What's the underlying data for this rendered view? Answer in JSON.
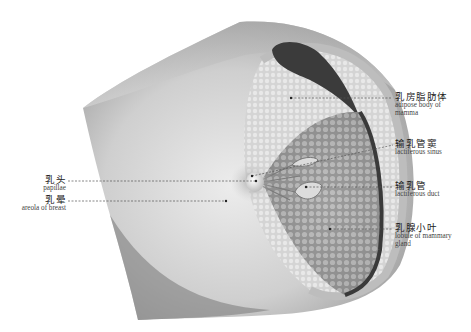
{
  "figure": {
    "type": "anatomical illustration",
    "colors": {
      "skin": "#bdbdbd",
      "skin_light": "#e6e6e6",
      "gland": "#9a9a9a",
      "gland_dark": "#4a4a4a",
      "leader_line": "#555555"
    }
  },
  "labels": {
    "right": [
      {
        "zh": "乳房脂肪体",
        "en_line1": "adipose body of",
        "en_line2": "mamma"
      },
      {
        "zh": "输乳管窦",
        "en_line1": "lactiferous sinus",
        "en_line2": ""
      },
      {
        "zh": "输乳管",
        "en_line1": "lactiferous duct",
        "en_line2": ""
      },
      {
        "zh": "乳腺小叶",
        "en_line1": "lobule of mammary",
        "en_line2": "gland"
      }
    ],
    "left": [
      {
        "zh": "乳头",
        "en_line1": "papillae"
      },
      {
        "zh": "乳晕",
        "en_line1": "areola of breast"
      }
    ]
  }
}
